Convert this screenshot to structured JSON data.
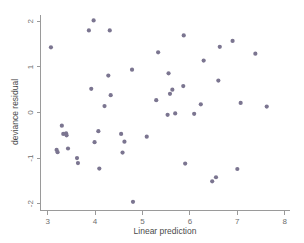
{
  "chart_data": {
    "type": "scatter",
    "title": "",
    "xlabel": "Linear prediction",
    "ylabel": "deviance residual",
    "xlim": [
      2.85,
      8.1
    ],
    "ylim": [
      -2.15,
      2.15
    ],
    "xticks": [
      3,
      4,
      5,
      6,
      7,
      8
    ],
    "xtick_labels": [
      "3",
      "4",
      "5",
      "6",
      "7",
      "8"
    ],
    "yticks": [
      2,
      1,
      0,
      -1,
      -2
    ],
    "ytick_labels": [
      "2",
      "1",
      "0",
      "-1",
      "-2"
    ],
    "grid": false,
    "legend": null,
    "marker_color": "#7b7590",
    "marker_size": 3.0,
    "axis_color": "#9a9a9a",
    "background_color": "#ffffff",
    "points": [
      {
        "x": 3.07,
        "y": 1.43
      },
      {
        "x": 3.19,
        "y": -0.82
      },
      {
        "x": 3.21,
        "y": -0.87
      },
      {
        "x": 3.3,
        "y": -0.29
      },
      {
        "x": 3.33,
        "y": -0.47
      },
      {
        "x": 3.39,
        "y": -0.46
      },
      {
        "x": 3.4,
        "y": -0.5
      },
      {
        "x": 3.43,
        "y": -0.79
      },
      {
        "x": 3.62,
        "y": -1.0
      },
      {
        "x": 3.64,
        "y": -1.11
      },
      {
        "x": 3.87,
        "y": 1.8
      },
      {
        "x": 3.92,
        "y": 0.52
      },
      {
        "x": 3.97,
        "y": 2.02
      },
      {
        "x": 3.99,
        "y": -0.65
      },
      {
        "x": 4.07,
        "y": -0.41
      },
      {
        "x": 4.09,
        "y": -1.23
      },
      {
        "x": 4.2,
        "y": 0.14
      },
      {
        "x": 4.28,
        "y": 0.81
      },
      {
        "x": 4.31,
        "y": 1.8
      },
      {
        "x": 4.33,
        "y": 0.38
      },
      {
        "x": 4.55,
        "y": -0.47
      },
      {
        "x": 4.58,
        "y": -0.88
      },
      {
        "x": 4.62,
        "y": -0.64
      },
      {
        "x": 4.78,
        "y": 0.94
      },
      {
        "x": 4.8,
        "y": -1.96
      },
      {
        "x": 5.09,
        "y": -0.53
      },
      {
        "x": 5.29,
        "y": 0.27
      },
      {
        "x": 5.33,
        "y": 1.32
      },
      {
        "x": 5.53,
        "y": -0.05
      },
      {
        "x": 5.55,
        "y": 0.86
      },
      {
        "x": 5.58,
        "y": 0.41
      },
      {
        "x": 5.63,
        "y": 0.5
      },
      {
        "x": 5.69,
        "y": -0.02
      },
      {
        "x": 5.86,
        "y": 0.58
      },
      {
        "x": 5.87,
        "y": 1.69
      },
      {
        "x": 5.9,
        "y": -1.12
      },
      {
        "x": 6.09,
        "y": -0.03
      },
      {
        "x": 6.23,
        "y": 0.18
      },
      {
        "x": 6.29,
        "y": 1.14
      },
      {
        "x": 6.47,
        "y": -1.51
      },
      {
        "x": 6.55,
        "y": -1.42
      },
      {
        "x": 6.6,
        "y": 0.7
      },
      {
        "x": 6.63,
        "y": 1.44
      },
      {
        "x": 6.9,
        "y": 1.57
      },
      {
        "x": 7.0,
        "y": -1.24
      },
      {
        "x": 7.07,
        "y": 0.21
      },
      {
        "x": 7.38,
        "y": 1.29
      },
      {
        "x": 7.62,
        "y": 0.13
      }
    ]
  },
  "axes": {
    "x_title": "Linear prediction",
    "y_title": "deviance residual"
  }
}
